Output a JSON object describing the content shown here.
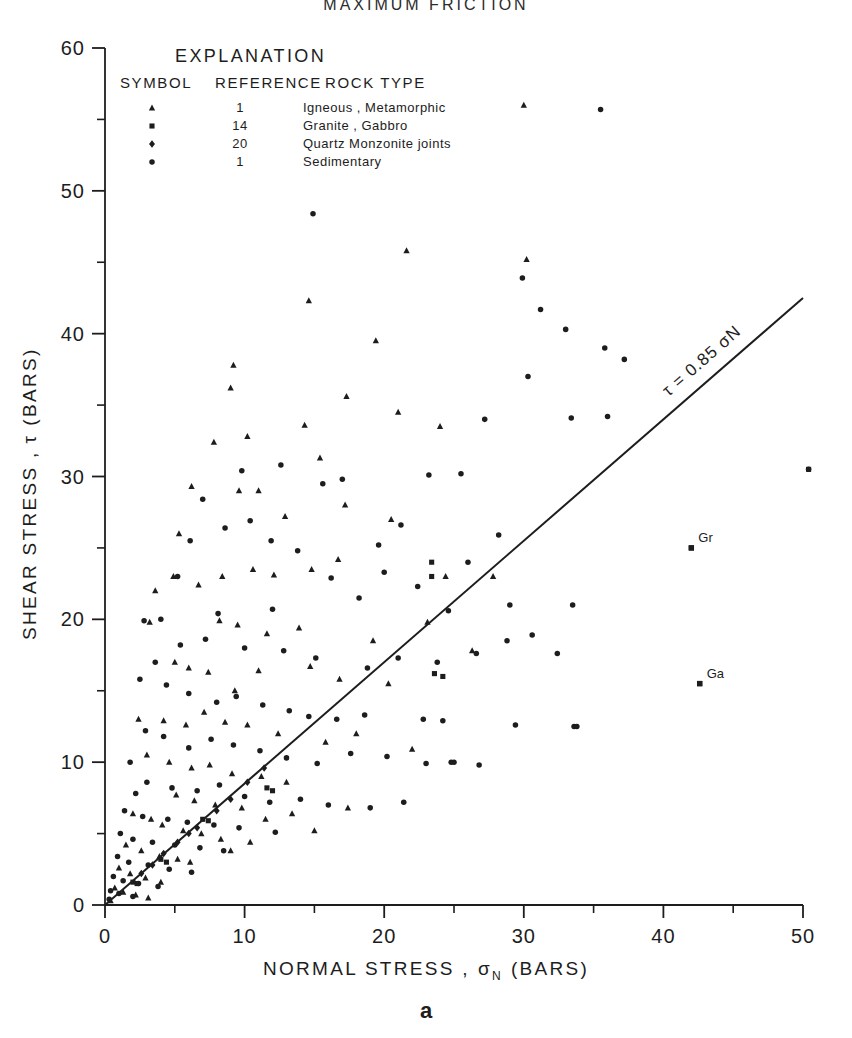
{
  "figure": {
    "title": "MAXIMUM  FRICTION",
    "panel_letter": "a",
    "background": "#ffffff",
    "ink": "#1d1d1d"
  },
  "legend": {
    "title": "EXPLANATION",
    "headers": [
      "SYMBOL",
      "REFERENCE",
      "ROCK TYPE"
    ],
    "rows": [
      {
        "symbol": "triangle",
        "reference": "1",
        "rock_type": "Igneous , Metamorphic"
      },
      {
        "symbol": "square",
        "reference": "14",
        "rock_type": "Granite , Gabbro"
      },
      {
        "symbol": "diamond",
        "reference": "20",
        "rock_type": "Quartz Monzonite joints"
      },
      {
        "symbol": "circle",
        "reference": "1",
        "rock_type": "Sedimentary"
      }
    ]
  },
  "chart_data": {
    "type": "scatter",
    "title": "MAXIMUM  FRICTION",
    "xlabel": "NORMAL STRESS , σN (BARS)",
    "ylabel": "SHEAR STRESS , τ (BARS)",
    "xlim": [
      0,
      50
    ],
    "ylim": [
      0,
      60
    ],
    "xticks": [
      0,
      10,
      20,
      30,
      40,
      50
    ],
    "yticks": [
      0,
      10,
      20,
      30,
      40,
      50,
      60
    ],
    "xminor": [
      5,
      15,
      25,
      35,
      45
    ],
    "yminor": [
      5,
      15,
      25,
      35,
      45,
      55
    ],
    "grid": false,
    "legend_position": "top-left-inside",
    "fit_line": {
      "label": "τ = 0.85 σN",
      "slope": 0.85,
      "intercept": 0,
      "x_from": 0,
      "x_to": 50
    },
    "annotations": [
      {
        "text": "Gr",
        "x": 42.0,
        "y": 25.0,
        "marker": "square"
      },
      {
        "text": "Ga",
        "x": 42.6,
        "y": 15.5,
        "marker": "square"
      }
    ],
    "series": [
      {
        "name": "Igneous , Metamorphic",
        "reference": "1",
        "marker": "triangle",
        "points": [
          [
            30.0,
            56.0
          ],
          [
            14.6,
            42.3
          ],
          [
            30.2,
            45.2
          ],
          [
            21.6,
            45.8
          ],
          [
            19.4,
            39.5
          ],
          [
            17.3,
            35.6
          ],
          [
            21.0,
            34.5
          ],
          [
            9.2,
            37.8
          ],
          [
            9.0,
            36.2
          ],
          [
            10.2,
            32.8
          ],
          [
            7.8,
            32.4
          ],
          [
            14.3,
            33.6
          ],
          [
            24.0,
            33.5
          ],
          [
            11.0,
            29.0
          ],
          [
            9.6,
            29.0
          ],
          [
            15.4,
            31.3
          ],
          [
            6.2,
            29.3
          ],
          [
            5.3,
            26.0
          ],
          [
            12.9,
            27.2
          ],
          [
            17.2,
            28.0
          ],
          [
            20.5,
            27.0
          ],
          [
            27.8,
            23.0
          ],
          [
            24.4,
            23.0
          ],
          [
            16.7,
            24.2
          ],
          [
            14.8,
            23.5
          ],
          [
            12.1,
            23.1
          ],
          [
            10.6,
            23.5
          ],
          [
            8.4,
            23.0
          ],
          [
            6.7,
            22.4
          ],
          [
            4.9,
            23.0
          ],
          [
            3.6,
            22.0
          ],
          [
            3.2,
            19.8
          ],
          [
            8.2,
            19.9
          ],
          [
            9.5,
            19.6
          ],
          [
            11.6,
            19.0
          ],
          [
            13.9,
            19.4
          ],
          [
            19.2,
            18.5
          ],
          [
            23.1,
            19.8
          ],
          [
            26.3,
            17.8
          ],
          [
            5.0,
            17.0
          ],
          [
            6.0,
            16.6
          ],
          [
            7.4,
            16.3
          ],
          [
            9.3,
            15.0
          ],
          [
            11.0,
            16.4
          ],
          [
            14.7,
            16.7
          ],
          [
            16.8,
            15.8
          ],
          [
            20.3,
            15.5
          ],
          [
            2.4,
            13.0
          ],
          [
            4.2,
            12.9
          ],
          [
            5.8,
            12.6
          ],
          [
            7.1,
            13.5
          ],
          [
            8.6,
            12.8
          ],
          [
            10.2,
            12.6
          ],
          [
            12.4,
            12.0
          ],
          [
            15.8,
            11.4
          ],
          [
            18.0,
            12.0
          ],
          [
            22.0,
            10.9
          ],
          [
            3.0,
            10.5
          ],
          [
            4.6,
            10.0
          ],
          [
            6.2,
            9.6
          ],
          [
            7.5,
            9.8
          ],
          [
            9.1,
            9.2
          ],
          [
            11.2,
            9.0
          ],
          [
            13.0,
            8.6
          ],
          [
            5.1,
            7.7
          ],
          [
            6.4,
            7.3
          ],
          [
            7.9,
            7.0
          ],
          [
            9.8,
            6.8
          ],
          [
            2.0,
            6.4
          ],
          [
            3.3,
            6.0
          ],
          [
            4.1,
            5.6
          ],
          [
            5.6,
            5.2
          ],
          [
            6.9,
            5.0
          ],
          [
            8.3,
            4.6
          ],
          [
            1.5,
            4.2
          ],
          [
            2.6,
            3.8
          ],
          [
            3.9,
            3.4
          ],
          [
            5.2,
            3.2
          ],
          [
            6.1,
            3.0
          ],
          [
            1.0,
            2.6
          ],
          [
            1.8,
            2.2
          ],
          [
            2.9,
            1.9
          ],
          [
            4.0,
            1.6
          ],
          [
            0.7,
            1.2
          ],
          [
            1.3,
            0.9
          ],
          [
            2.2,
            0.7
          ],
          [
            3.1,
            0.5
          ],
          [
            0.4,
            0.3
          ],
          [
            11.5,
            6.0
          ],
          [
            13.4,
            6.4
          ],
          [
            15.0,
            5.2
          ],
          [
            17.4,
            6.8
          ],
          [
            9.0,
            3.8
          ],
          [
            10.4,
            4.4
          ]
        ]
      },
      {
        "name": "Sedimentary",
        "reference": "1",
        "marker": "circle",
        "points": [
          [
            35.5,
            55.7
          ],
          [
            14.9,
            48.4
          ],
          [
            29.9,
            43.9
          ],
          [
            31.2,
            41.7
          ],
          [
            33.0,
            40.3
          ],
          [
            35.8,
            39.0
          ],
          [
            37.2,
            38.2
          ],
          [
            30.3,
            37.0
          ],
          [
            33.4,
            34.1
          ],
          [
            36.0,
            34.2
          ],
          [
            27.2,
            34.0
          ],
          [
            25.5,
            30.2
          ],
          [
            23.2,
            30.1
          ],
          [
            17.0,
            29.8
          ],
          [
            15.6,
            29.5
          ],
          [
            12.6,
            30.8
          ],
          [
            9.8,
            30.4
          ],
          [
            7.0,
            28.4
          ],
          [
            6.1,
            25.5
          ],
          [
            21.2,
            26.6
          ],
          [
            19.6,
            25.2
          ],
          [
            28.2,
            25.9
          ],
          [
            26.0,
            24.0
          ],
          [
            22.4,
            22.3
          ],
          [
            20.0,
            23.3
          ],
          [
            18.2,
            21.5
          ],
          [
            16.2,
            22.9
          ],
          [
            13.8,
            24.8
          ],
          [
            11.9,
            25.5
          ],
          [
            10.4,
            26.9
          ],
          [
            8.6,
            26.4
          ],
          [
            5.2,
            23.0
          ],
          [
            4.0,
            20.0
          ],
          [
            2.8,
            19.9
          ],
          [
            8.1,
            20.4
          ],
          [
            12.0,
            20.7
          ],
          [
            24.6,
            20.6
          ],
          [
            29.0,
            21.0
          ],
          [
            33.5,
            21.0
          ],
          [
            30.6,
            18.9
          ],
          [
            32.4,
            17.6
          ],
          [
            28.8,
            18.5
          ],
          [
            26.6,
            17.6
          ],
          [
            23.8,
            17.0
          ],
          [
            21.0,
            17.3
          ],
          [
            18.8,
            16.6
          ],
          [
            15.1,
            17.3
          ],
          [
            12.8,
            17.8
          ],
          [
            10.0,
            18.0
          ],
          [
            7.2,
            18.6
          ],
          [
            5.4,
            18.2
          ],
          [
            3.6,
            17.0
          ],
          [
            2.5,
            15.8
          ],
          [
            4.4,
            15.4
          ],
          [
            6.0,
            14.8
          ],
          [
            8.0,
            14.2
          ],
          [
            9.4,
            14.6
          ],
          [
            11.3,
            14.0
          ],
          [
            13.2,
            13.6
          ],
          [
            14.6,
            13.2
          ],
          [
            16.6,
            13.0
          ],
          [
            18.6,
            13.3
          ],
          [
            22.8,
            13.0
          ],
          [
            24.2,
            12.9
          ],
          [
            29.4,
            12.6
          ],
          [
            33.6,
            12.5
          ],
          [
            25.0,
            10.0
          ],
          [
            26.8,
            9.8
          ],
          [
            20.2,
            10.4
          ],
          [
            17.6,
            10.6
          ],
          [
            15.2,
            9.9
          ],
          [
            13.0,
            10.3
          ],
          [
            11.1,
            10.8
          ],
          [
            9.2,
            11.2
          ],
          [
            7.6,
            11.6
          ],
          [
            6.0,
            11.0
          ],
          [
            4.2,
            11.8
          ],
          [
            2.9,
            12.2
          ],
          [
            1.8,
            10.0
          ],
          [
            3.0,
            8.6
          ],
          [
            4.8,
            8.2
          ],
          [
            6.6,
            8.0
          ],
          [
            8.2,
            8.4
          ],
          [
            10.0,
            7.6
          ],
          [
            11.8,
            7.2
          ],
          [
            14.0,
            7.4
          ],
          [
            16.0,
            7.0
          ],
          [
            19.0,
            6.8
          ],
          [
            21.4,
            7.2
          ],
          [
            2.2,
            7.8
          ],
          [
            1.4,
            6.6
          ],
          [
            2.7,
            6.2
          ],
          [
            4.5,
            6.0
          ],
          [
            5.9,
            5.8
          ],
          [
            7.8,
            5.6
          ],
          [
            9.6,
            5.4
          ],
          [
            12.2,
            5.1
          ],
          [
            1.1,
            5.0
          ],
          [
            2.0,
            4.6
          ],
          [
            3.4,
            4.4
          ],
          [
            5.0,
            4.2
          ],
          [
            6.8,
            4.0
          ],
          [
            8.5,
            3.8
          ],
          [
            0.9,
            3.4
          ],
          [
            1.7,
            3.0
          ],
          [
            3.1,
            2.8
          ],
          [
            4.6,
            2.5
          ],
          [
            6.2,
            2.3
          ],
          [
            0.6,
            2.0
          ],
          [
            1.3,
            1.7
          ],
          [
            2.4,
            1.5
          ],
          [
            3.8,
            1.3
          ],
          [
            0.4,
            1.0
          ],
          [
            1.0,
            0.8
          ],
          [
            2.0,
            0.6
          ],
          [
            0.3,
            0.4
          ],
          [
            50.4,
            30.5
          ],
          [
            33.8,
            12.5
          ],
          [
            23.0,
            9.9
          ],
          [
            24.8,
            10.0
          ]
        ]
      },
      {
        "name": "Granite , Gabbro",
        "reference": "14",
        "marker": "square",
        "points": [
          [
            42.0,
            25.0
          ],
          [
            42.6,
            15.5
          ],
          [
            50.4,
            30.5
          ],
          [
            23.4,
            24.0
          ],
          [
            23.4,
            23.0
          ],
          [
            23.6,
            16.2
          ],
          [
            24.2,
            16.0
          ],
          [
            11.6,
            8.2
          ],
          [
            12.0,
            8.0
          ],
          [
            7.0,
            6.0
          ],
          [
            7.4,
            5.9
          ],
          [
            4.0,
            3.2
          ],
          [
            4.4,
            3.0
          ],
          [
            2.0,
            1.6
          ],
          [
            2.3,
            1.5
          ]
        ]
      },
      {
        "name": "Quartz Monzonite joints",
        "reference": "20",
        "marker": "diamond",
        "points": [
          [
            6.0,
            5.0
          ],
          [
            6.6,
            5.4
          ],
          [
            5.2,
            4.4
          ],
          [
            8.0,
            6.6
          ],
          [
            9.0,
            7.4
          ],
          [
            3.4,
            2.8
          ],
          [
            10.2,
            8.6
          ],
          [
            4.2,
            3.6
          ],
          [
            2.6,
            2.2
          ],
          [
            11.4,
            9.6
          ]
        ]
      }
    ]
  },
  "axes": {
    "x_tick_labels": [
      "0",
      "10",
      "20",
      "30",
      "40",
      "50"
    ],
    "y_tick_labels": [
      "0",
      "10",
      "20",
      "30",
      "40",
      "50",
      "60"
    ],
    "x_axis_title_parts": {
      "main": "NORMAL  STRESS ,",
      "sym": "σ",
      "sub": "N",
      "unit": "(BARS)"
    },
    "y_axis_title_parts": {
      "main": "SHEAR  STRESS ,",
      "sym": "τ",
      "unit": "(BARS)"
    }
  }
}
